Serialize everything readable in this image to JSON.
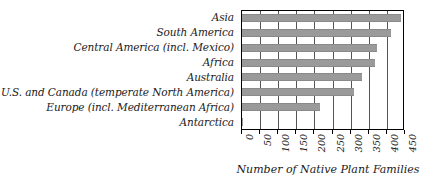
{
  "chart_data": {
    "type": "bar",
    "orientation": "horizontal",
    "title": "",
    "xlabel": "Number of Native Plant Families",
    "ylabel": "",
    "xlim": [
      0,
      450
    ],
    "xticks": [
      0,
      50,
      100,
      150,
      200,
      250,
      300,
      350,
      400,
      450
    ],
    "xtick_labels": [
      "0",
      "50",
      "100",
      "150",
      "200",
      "250",
      "300",
      "350",
      "400",
      "450"
    ],
    "grid": "vertical",
    "legend": "none",
    "bar_color": "#9a9a9a",
    "categories": [
      "Asia",
      "South America",
      "Central America (incl. Mexico)",
      "Africa",
      "Australia",
      "U.S. and Canada (temperate North America)",
      "Europe (incl. Mediterranean Africa)",
      "Antarctica"
    ],
    "values": [
      440,
      410,
      373,
      368,
      330,
      308,
      215,
      2
    ]
  }
}
